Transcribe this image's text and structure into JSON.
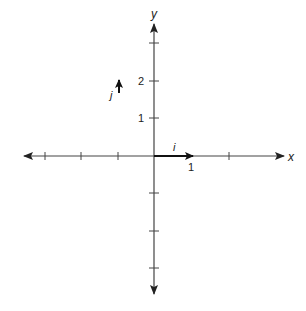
{
  "diagram": {
    "axes": {
      "x_label": "x",
      "y_label": "y",
      "x_ticks": [
        -3,
        -2,
        -1,
        1,
        2
      ],
      "y_ticks": [
        -3,
        -2,
        -1,
        1,
        2,
        3
      ],
      "tick_labels": {
        "y_2": "2",
        "y_1": "1",
        "x_1": "1"
      }
    },
    "vectors": [
      {
        "name": "i",
        "label": "i",
        "from": [
          0,
          0
        ],
        "to": [
          1,
          0
        ]
      },
      {
        "name": "j",
        "label": "j",
        "from": [
          -1,
          1
        ],
        "to": [
          -1,
          2
        ]
      }
    ],
    "colors": {
      "axis": "#333333",
      "vector": "#222222",
      "background": "#ffffff"
    }
  }
}
